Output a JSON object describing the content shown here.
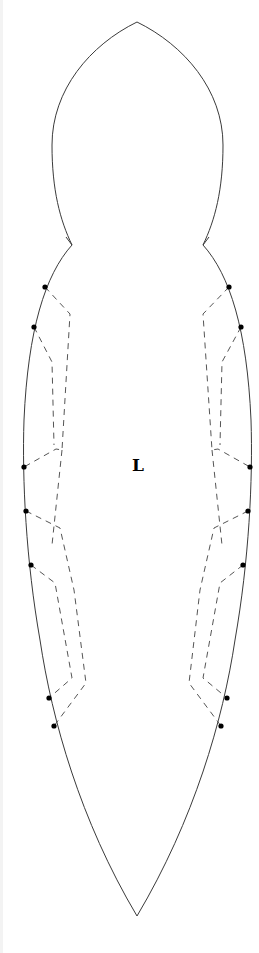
{
  "diagram": {
    "label": "L",
    "label_position": [
      138,
      471
    ],
    "colors": {
      "outline": "#3a3a3a",
      "dashed": "#555555",
      "dot": "#000000",
      "background": "#ffffff"
    },
    "outline": {
      "head_top": [
        137,
        22
      ],
      "left_notch": [
        72,
        245
      ],
      "right_notch": [
        203,
        245
      ],
      "tail_tip": [
        137,
        916
      ]
    },
    "left_points": [
      {
        "id": "L1",
        "x": 45,
        "y": 287
      },
      {
        "id": "L2",
        "x": 34,
        "y": 327
      },
      {
        "id": "L3",
        "x": 24,
        "y": 467
      },
      {
        "id": "L4",
        "x": 26,
        "y": 511
      },
      {
        "id": "L5",
        "x": 31,
        "y": 565
      },
      {
        "id": "L6",
        "x": 49,
        "y": 698
      },
      {
        "id": "L7",
        "x": 54,
        "y": 726
      }
    ],
    "right_points": [
      {
        "id": "R1",
        "x": 229,
        "y": 287
      },
      {
        "id": "R2",
        "x": 241,
        "y": 327
      },
      {
        "id": "R3",
        "x": 250,
        "y": 467
      },
      {
        "id": "R4",
        "x": 248,
        "y": 511
      },
      {
        "id": "R5",
        "x": 243,
        "y": 565
      },
      {
        "id": "R6",
        "x": 227,
        "y": 698
      },
      {
        "id": "R7",
        "x": 221,
        "y": 726
      }
    ]
  }
}
